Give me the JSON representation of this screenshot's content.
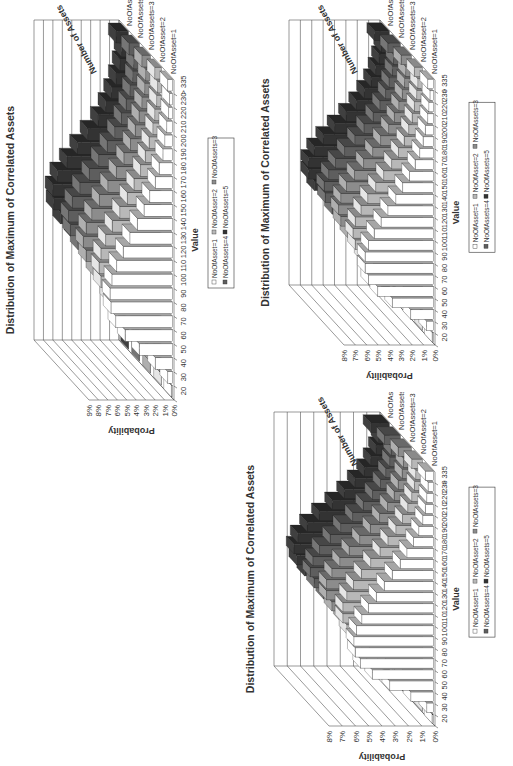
{
  "chart_data": [
    {
      "id": "chart-a",
      "type": "bar",
      "subtype": "3d-bar",
      "orientation": "rotated-90",
      "title": "Distribution of Maximum of Correlated Assets",
      "xlabel": "Value",
      "ylabel": "Probability",
      "zlabel": "Number of Assets",
      "ylim": [
        0,
        9
      ],
      "yticks": [
        "0%",
        "1%",
        "2%",
        "3%",
        "4%",
        "5%",
        "6%",
        "7%",
        "8%",
        "9%"
      ],
      "categories": [
        "20",
        "30",
        "40",
        "50",
        "60",
        "70",
        "80",
        "90",
        "100",
        "110",
        "120",
        "130",
        "140",
        "150",
        "160",
        "170",
        "180",
        "190",
        "200",
        "210",
        "220",
        "230",
        "> 335"
      ],
      "series": [
        {
          "name": "NoOfAsset=1",
          "color": "#ffffff",
          "values": [
            0.1,
            0.5,
            1.8,
            3.5,
            5.0,
            6.0,
            6.5,
            6.6,
            6.4,
            5.9,
            5.2,
            4.5,
            3.7,
            3.0,
            2.4,
            1.8,
            1.4,
            1.0,
            0.8,
            0.6,
            0.4,
            0.3,
            0.5
          ]
        },
        {
          "name": "NoOfAsset=2",
          "color": "#b8b8b8",
          "values": [
            0.0,
            0.2,
            0.6,
            1.6,
            3.0,
            4.5,
            5.7,
            6.4,
            6.6,
            6.4,
            5.9,
            5.2,
            4.4,
            3.6,
            2.9,
            2.2,
            1.7,
            1.3,
            0.9,
            0.7,
            0.5,
            0.4,
            0.7
          ]
        },
        {
          "name": "NoOfAssets=3",
          "color": "#8c8c8c",
          "values": [
            0.0,
            0.1,
            0.3,
            0.9,
            2.0,
            3.4,
            4.8,
            6.0,
            6.8,
            7.1,
            6.8,
            6.2,
            5.4,
            4.5,
            3.6,
            2.8,
            2.1,
            1.6,
            1.2,
            0.9,
            0.6,
            0.5,
            0.9
          ]
        },
        {
          "name": "NoOfAssets=4",
          "color": "#5e5e5e",
          "values": [
            0.0,
            0.0,
            0.1,
            0.5,
            1.3,
            2.5,
            3.9,
            5.3,
            6.5,
            7.3,
            7.5,
            7.1,
            6.3,
            5.3,
            4.3,
            3.4,
            2.6,
            1.9,
            1.4,
            1.0,
            0.7,
            0.6,
            1.1
          ]
        },
        {
          "name": "NoOfAssets=5",
          "color": "#333333",
          "values": [
            0.0,
            0.0,
            0.1,
            0.3,
            0.8,
            1.8,
            3.1,
            4.6,
            6.0,
            7.2,
            7.9,
            8.0,
            7.5,
            6.5,
            5.4,
            4.3,
            3.2,
            2.4,
            1.8,
            1.3,
            0.9,
            0.7,
            1.3
          ]
        }
      ],
      "legend_position": "bottom",
      "grid": true
    },
    {
      "id": "chart-b",
      "type": "bar",
      "subtype": "3d-bar",
      "orientation": "rotated-90",
      "title": "Distribution of Maximum of Correlated Assets",
      "xlabel": "Value",
      "ylabel": "Probability",
      "zlabel": "Number of Assets",
      "ylim": [
        0,
        8
      ],
      "yticks": [
        "0%",
        "1%",
        "2%",
        "3%",
        "4%",
        "5%",
        "6%",
        "7%",
        "8%"
      ],
      "categories": [
        "20",
        "30",
        "40",
        "50",
        "60",
        "70",
        "80",
        "90",
        "100",
        "110",
        "120",
        "130",
        "140",
        "150",
        "160",
        "170",
        "180",
        "190",
        "200",
        "210",
        "220",
        "230",
        "> 335"
      ],
      "series": [
        {
          "name": "NoOfAsset=1",
          "color": "#ffffff",
          "values": [
            0.1,
            0.6,
            2.0,
            3.6,
            4.9,
            5.7,
            6.0,
            6.0,
            5.7,
            5.2,
            4.6,
            4.0,
            3.3,
            2.7,
            2.1,
            1.6,
            1.2,
            0.9,
            0.7,
            0.5,
            0.4,
            0.3,
            0.5
          ]
        },
        {
          "name": "NoOfAsset=2",
          "color": "#b8b8b8",
          "values": [
            0.0,
            0.2,
            0.7,
            1.7,
            3.0,
            4.3,
            5.3,
            5.9,
            6.1,
            5.9,
            5.4,
            4.8,
            4.1,
            3.4,
            2.7,
            2.1,
            1.6,
            1.2,
            0.9,
            0.7,
            0.5,
            0.4,
            0.7
          ]
        },
        {
          "name": "NoOfAssets=3",
          "color": "#8c8c8c",
          "values": [
            0.0,
            0.1,
            0.3,
            1.0,
            2.1,
            3.4,
            4.6,
            5.6,
            6.2,
            6.4,
            6.2,
            5.7,
            5.0,
            4.2,
            3.4,
            2.7,
            2.0,
            1.5,
            1.1,
            0.8,
            0.6,
            0.5,
            0.9
          ]
        },
        {
          "name": "NoOfAssets=4",
          "color": "#5e5e5e",
          "values": [
            0.0,
            0.0,
            0.1,
            0.5,
            1.3,
            2.5,
            3.8,
            5.0,
            6.0,
            6.6,
            6.7,
            6.3,
            5.7,
            4.9,
            4.0,
            3.2,
            2.4,
            1.8,
            1.3,
            1.0,
            0.7,
            0.6,
            1.1
          ]
        },
        {
          "name": "NoOfAssets=5",
          "color": "#333333",
          "values": [
            0.0,
            0.0,
            0.1,
            0.3,
            0.8,
            1.8,
            3.0,
            4.4,
            5.6,
            6.6,
            7.1,
            7.1,
            6.6,
            5.8,
            4.8,
            3.8,
            2.9,
            2.2,
            1.6,
            1.2,
            0.9,
            0.7,
            1.3
          ]
        }
      ],
      "legend_position": "bottom",
      "grid": true
    },
    {
      "id": "chart-c",
      "type": "bar",
      "subtype": "3d-bar",
      "orientation": "rotated-90",
      "title": "Distribution of Maximum of Correlated Assets",
      "xlabel": "Value",
      "ylabel": "Probability",
      "zlabel": "Number of Assets",
      "ylim": [
        0,
        8
      ],
      "yticks": [
        "0%",
        "1%",
        "2%",
        "3%",
        "4%",
        "5%",
        "6%",
        "7%",
        "8%"
      ],
      "categories": [
        "20",
        "30",
        "40",
        "50",
        "60",
        "70",
        "80",
        "90",
        "100",
        "110",
        "120",
        "130",
        "140",
        "150",
        "160",
        "170",
        "180",
        "190",
        "200",
        "210",
        "220",
        "230",
        "> 335"
      ],
      "series": [
        {
          "name": "NoOfAsset=1",
          "color": "#ffffff",
          "values": [
            0.1,
            0.5,
            1.7,
            3.3,
            4.6,
            5.5,
            5.9,
            6.0,
            5.8,
            5.4,
            4.9,
            4.3,
            3.7,
            3.1,
            2.5,
            2.0,
            1.5,
            1.1,
            0.8,
            0.6,
            0.5,
            0.4,
            0.6
          ]
        },
        {
          "name": "NoOfAsset=2",
          "color": "#b8b8b8",
          "values": [
            0.0,
            0.2,
            0.6,
            1.5,
            2.8,
            4.0,
            5.0,
            5.7,
            6.0,
            6.0,
            5.7,
            5.2,
            4.6,
            3.9,
            3.2,
            2.6,
            2.0,
            1.5,
            1.1,
            0.8,
            0.6,
            0.5,
            0.8
          ]
        },
        {
          "name": "NoOfAssets=3",
          "color": "#8c8c8c",
          "values": [
            0.0,
            0.1,
            0.3,
            0.9,
            1.9,
            3.1,
            4.3,
            5.3,
            6.0,
            6.4,
            6.4,
            6.0,
            5.4,
            4.7,
            3.9,
            3.1,
            2.4,
            1.8,
            1.3,
            1.0,
            0.7,
            0.6,
            1.0
          ]
        },
        {
          "name": "NoOfAssets=4",
          "color": "#5e5e5e",
          "values": [
            0.0,
            0.0,
            0.1,
            0.5,
            1.2,
            2.3,
            3.5,
            4.7,
            5.8,
            6.5,
            6.8,
            6.6,
            6.1,
            5.3,
            4.5,
            3.6,
            2.8,
            2.1,
            1.5,
            1.1,
            0.8,
            0.7,
            1.2
          ]
        },
        {
          "name": "NoOfAssets=5",
          "color": "#333333",
          "values": [
            0.0,
            0.0,
            0.1,
            0.3,
            0.8,
            1.6,
            2.8,
            4.1,
            5.4,
            6.4,
            7.0,
            7.2,
            6.9,
            6.2,
            5.3,
            4.3,
            3.4,
            2.6,
            1.9,
            1.4,
            1.0,
            0.8,
            1.4
          ]
        }
      ],
      "legend_position": "bottom",
      "grid": true
    }
  ],
  "charts": [
    {
      "title": "Distribution of Maximum of Correlated Assets",
      "xlabel": "Value",
      "ylabel": "Probability",
      "zlabel": "Number of Assets",
      "legend": [
        "NoOfAsset=1",
        "NoOfAsset=2",
        "NoOfAssets=3",
        "NoOfAssets=4",
        "NoOfAssets=5"
      ]
    },
    {
      "title": "Distribution of Maximum of Correlated Assets",
      "xlabel": "Value",
      "ylabel": "Probability",
      "zlabel": "Number of Assets",
      "legend": [
        "NoOfAsset=1",
        "NoOfAsset=2",
        "NoOfAssets=3",
        "NoOfAssets=4",
        "NoOfAssets=5"
      ]
    },
    {
      "title": "Distribution of Maximum of Correlated Assets",
      "xlabel": "Value",
      "ylabel": "Probability",
      "zlabel": "Number of Assets",
      "legend": [
        "NoOfAsset=1",
        "NoOfAsset=2",
        "NoOfAssets=3",
        "NoOfAssets=4",
        "NoOfAssets=5"
      ]
    }
  ]
}
